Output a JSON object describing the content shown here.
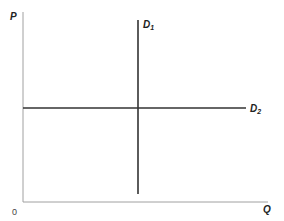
{
  "diagram": {
    "type": "supply-demand",
    "axes": {
      "y_label": "P",
      "x_label": "Q",
      "origin_label": "0",
      "axis_color": "#999999"
    },
    "curves": [
      {
        "name": "D",
        "subscript": "1",
        "orientation": "vertical",
        "description": "perfectly inelastic demand",
        "color": "#333333"
      },
      {
        "name": "D",
        "subscript": "2",
        "orientation": "horizontal",
        "description": "perfectly elastic demand",
        "color": "#333333"
      }
    ]
  }
}
